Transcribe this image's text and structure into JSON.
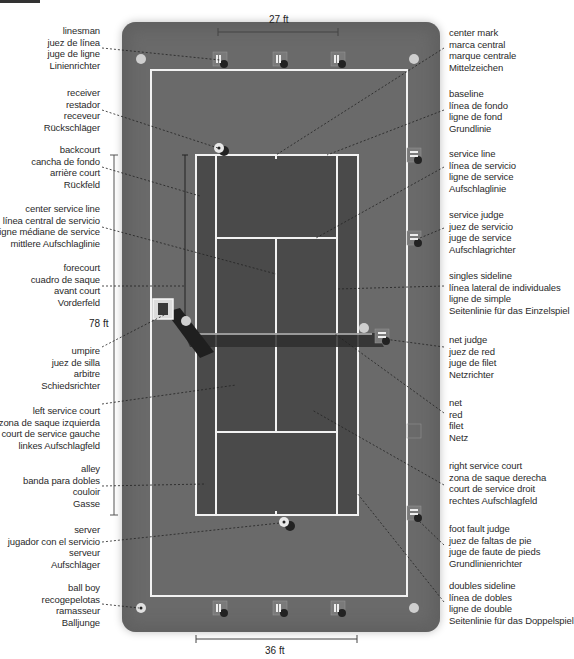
{
  "diagram": {
    "title_fragment": "",
    "colors": {
      "surround": "#6a6a6a",
      "court": "#4a4a4a",
      "lines": "#f2f2f2",
      "net": "#2e2e2e",
      "text": "#2a2a2a"
    },
    "dimensions": {
      "top": "27 ft",
      "bottom": "36 ft",
      "length": "78 ft"
    },
    "left_labels": [
      {
        "en": "linesman",
        "es": "juez de línea",
        "fr": "juge de ligne",
        "de": "Linienrichter"
      },
      {
        "en": "receiver",
        "es": "restador",
        "fr": "receveur",
        "de": "Rückschläger"
      },
      {
        "en": "backcourt",
        "es": "cancha de fondo",
        "fr": "arrière court",
        "de": "Rückfeld"
      },
      {
        "en": "center service line",
        "es": "línea central de servicio",
        "fr": "ligne médiane de service",
        "de": "mittlere Aufschlaglinie"
      },
      {
        "en": "forecourt",
        "es": "cuadro de saque",
        "fr": "avant court",
        "de": "Vorderfeld"
      },
      {
        "en": "umpire",
        "es": "juez de silla",
        "fr": "arbitre",
        "de": "Schiedsrichter"
      },
      {
        "en": "left service court",
        "es": "zona de saque izquierda",
        "fr": "court de service gauche",
        "de": "linkes Aufschlagfeld"
      },
      {
        "en": "alley",
        "es": "banda para dobles",
        "fr": "couloir",
        "de": "Gasse"
      },
      {
        "en": "server",
        "es": "jugador con el servicio",
        "fr": "serveur",
        "de": "Aufschläger"
      },
      {
        "en": "ball boy",
        "es": "recogepelotas",
        "fr": "ramasseur",
        "de": "Balljunge"
      }
    ],
    "right_labels": [
      {
        "en": "center mark",
        "es": "marca central",
        "fr": "marque centrale",
        "de": "Mittelzeichen"
      },
      {
        "en": "baseline",
        "es": "línea de fondo",
        "fr": "ligne de fond",
        "de": "Grundlinie"
      },
      {
        "en": "service line",
        "es": "línea de servicio",
        "fr": "ligne de service",
        "de": "Aufschlaglinie"
      },
      {
        "en": "service judge",
        "es": "juez de servicio",
        "fr": "juge de service",
        "de": "Aufschlagrichter"
      },
      {
        "en": "singles sideline",
        "es": "línea lateral de individuales",
        "fr": "ligne de simple",
        "de": "Seitenlinie für das Einzelspiel"
      },
      {
        "en": "net judge",
        "es": "juez de red",
        "fr": "juge de filet",
        "de": "Netzrichter"
      },
      {
        "en": "net",
        "es": "red",
        "fr": "filet",
        "de": "Netz"
      },
      {
        "en": "right service court",
        "es": "zona de saque derecha",
        "fr": "court de service droit",
        "de": "rechtes Aufschlagfeld"
      },
      {
        "en": "foot fault judge",
        "es": "juez de faltas de pie",
        "fr": "juge de faute de pieds",
        "de": "Grundlinienrichter"
      },
      {
        "en": "doubles sideline",
        "es": "línea de dobles",
        "fr": "ligne de double",
        "de": "Seitenlinie für das Doppelspiel"
      }
    ]
  }
}
